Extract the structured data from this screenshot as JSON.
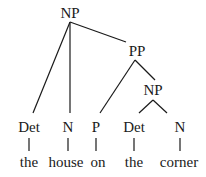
{
  "diagram": {
    "type": "syntax-tree",
    "phrase": "the house on the corner",
    "nodes": {
      "np_root": "NP",
      "pp": "PP",
      "np_inner": "NP",
      "det1": "Det",
      "n1": "N",
      "p": "P",
      "det2": "Det",
      "n2": "N"
    },
    "words": {
      "w1": "the",
      "w2": "house",
      "w3": "on",
      "w4": "the",
      "w5": "corner"
    },
    "edges": [
      [
        "NP",
        "Det"
      ],
      [
        "NP",
        "N"
      ],
      [
        "NP",
        "PP"
      ],
      [
        "PP",
        "P"
      ],
      [
        "PP",
        "NP"
      ],
      [
        "NP",
        "Det"
      ],
      [
        "NP",
        "N"
      ],
      [
        "Det",
        "the"
      ],
      [
        "N",
        "house"
      ],
      [
        "P",
        "on"
      ],
      [
        "Det",
        "the"
      ],
      [
        "N",
        "corner"
      ]
    ]
  }
}
